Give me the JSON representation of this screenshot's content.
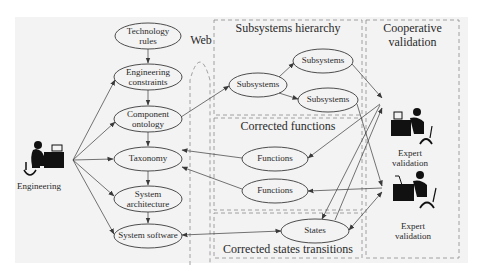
{
  "diagram": {
    "left_column": {
      "nodes": [
        {
          "id": "technology-rules",
          "lines": [
            "Technology",
            "rules"
          ]
        },
        {
          "id": "engineering-constraints",
          "lines": [
            "Engineering",
            "constraints"
          ]
        },
        {
          "id": "component-ontology",
          "lines": [
            "Component",
            "ontology"
          ]
        },
        {
          "id": "taxonomy",
          "lines": [
            "Taxonomy"
          ]
        },
        {
          "id": "system-architecture",
          "lines": [
            "System",
            "architecture"
          ]
        },
        {
          "id": "system-software",
          "lines": [
            "System software"
          ]
        }
      ]
    },
    "actors": {
      "engineering": {
        "label": "Engineering"
      },
      "expert_1": {
        "lines": [
          "Expert",
          "validation"
        ]
      },
      "expert_2": {
        "lines": [
          "Expert",
          "validation"
        ]
      }
    },
    "web_label": "Web",
    "groups": {
      "subsystems_hierarchy": {
        "title": "Subsystems hierarchy",
        "nodes": [
          "Subsystems",
          "Subsystems",
          "Subsystems"
        ]
      },
      "corrected_functions": {
        "title": "Corrected functions",
        "nodes": [
          "Functions",
          "Functions"
        ]
      },
      "corrected_states_transitions": {
        "title": "Corrected states transitions",
        "nodes": [
          "States"
        ]
      },
      "cooperative_validation": {
        "title_lines": [
          "Cooperative",
          "validation"
        ]
      }
    },
    "edges": [
      {
        "from": "Technology rules",
        "to": "Engineering constraints"
      },
      {
        "from": "Engineering constraints",
        "to": "Component ontology"
      },
      {
        "from": "Component ontology",
        "to": "Taxonomy"
      },
      {
        "from": "Taxonomy",
        "to": "System architecture"
      },
      {
        "from": "System architecture",
        "to": "System software"
      },
      {
        "from": "Engineering",
        "to": "Engineering constraints"
      },
      {
        "from": "Engineering",
        "to": "Component ontology"
      },
      {
        "from": "Engineering",
        "to": "Taxonomy"
      },
      {
        "from": "Engineering",
        "to": "System architecture"
      },
      {
        "from": "Engineering",
        "to": "System software"
      },
      {
        "from": "Component ontology",
        "to": "Subsystems"
      },
      {
        "from": "Subsystems",
        "to": "Subsystems (upper)"
      },
      {
        "from": "Subsystems",
        "to": "Subsystems (lower)"
      },
      {
        "from": "Subsystems (upper)",
        "to": "Expert validation 1"
      },
      {
        "from": "Subsystems (lower)",
        "to": "Expert validation 2"
      },
      {
        "from": "Expert validation 1",
        "to": "Functions (1)"
      },
      {
        "from": "Expert validation 2",
        "to": "Functions (2)"
      },
      {
        "from": "Functions (1)",
        "to": "Taxonomy"
      },
      {
        "from": "Functions (2)",
        "to": "Taxonomy"
      },
      {
        "from": "Expert validation 1",
        "to": "States"
      },
      {
        "from": "States",
        "to": "Expert validation 1"
      },
      {
        "from": "States",
        "to": "Expert validation 2",
        "bidirectional": true
      },
      {
        "from": "System software",
        "to": "States",
        "bidirectional": true
      }
    ],
    "colors": {
      "background": "#f3f3f3",
      "line": "#3a3a3a",
      "dashed": "#8a8a8a",
      "figure": "#111111"
    }
  }
}
